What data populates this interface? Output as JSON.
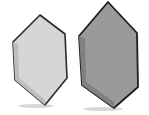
{
  "scene": {
    "background": "#ffffff",
    "shapes": [
      {
        "name": "light-hexagon",
        "fill": "#d6d6d6",
        "shade": "#bdbdbd",
        "stroke": "#2a2a2a",
        "points": "40,15 65,34 67,78 45,105 15,80 13,42"
      },
      {
        "name": "dark-hexagon",
        "fill": "#9a9a9a",
        "shade": "#808080",
        "stroke": "#1e1e1e",
        "points": "108,2 137,33 138,87 114,108 82,85 79,36"
      }
    ]
  }
}
